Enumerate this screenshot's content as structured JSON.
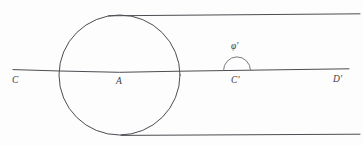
{
  "figure": {
    "background_color": "#fdfdfd",
    "stroke_color": "#4c4c52",
    "width": 363,
    "height": 146
  },
  "labels": {
    "point_c": "C",
    "point_a": "A",
    "point_c_prime": "C'",
    "point_d_prime": "D'",
    "angle_phi_prime": "φ'"
  },
  "elements": {
    "circle": {
      "name": "circle",
      "center_x": 119.5,
      "center_y": 75,
      "radius": 60
    },
    "upper_parallel_line": {
      "name": "upper-parallel-line",
      "x1": 108,
      "y1": 15.5,
      "x2": 360,
      "y2": 14
    },
    "lower_parallel_line": {
      "name": "lower-parallel-line",
      "x1": 122,
      "y1": 135,
      "x2": 360,
      "y2": 134
    },
    "axis_line": {
      "name": "axis-line",
      "x1": 13,
      "y1": 70,
      "x2": 349,
      "y2": 69
    },
    "angle_arc": {
      "name": "angle-arc",
      "center_x": 237,
      "center_y": 70.5,
      "radius": 13.5
    }
  }
}
